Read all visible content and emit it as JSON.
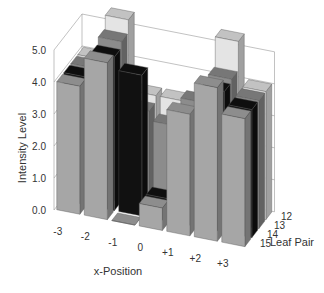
{
  "chart_data": {
    "type": "bar3d",
    "title": "",
    "xlabel": "x-Position",
    "ylabel": "Intensity Level",
    "zlabel": "Leaf Pair",
    "x_categories": [
      "-3",
      "-2",
      "-1",
      "0",
      "+1",
      "+2",
      "+3"
    ],
    "z_categories": [
      "12",
      "13",
      "14",
      "15"
    ],
    "y_ticks": [
      "0.0",
      "1.0",
      "2.0",
      "3.0",
      "4.0",
      "5.0"
    ],
    "ylim": [
      0,
      5
    ],
    "grid": true,
    "series": [
      {
        "name": "12",
        "color": "#e4e4e4",
        "values": [
          4.0,
          5.4,
          3.2,
          3.2,
          3.2,
          5.4,
          4.0
        ]
      },
      {
        "name": "13",
        "color": "#8c8c8c",
        "values": [
          4.0,
          5.0,
          3.0,
          2.7,
          3.6,
          4.5,
          4.0
        ]
      },
      {
        "name": "14",
        "color": "#111111",
        "values": [
          4.0,
          4.8,
          4.4,
          0.7,
          3.1,
          4.4,
          4.0
        ]
      },
      {
        "name": "15",
        "color": "#a6a6a6",
        "values": [
          4.0,
          4.9,
          0.0,
          0.7,
          3.8,
          4.8,
          4.0
        ]
      }
    ]
  }
}
